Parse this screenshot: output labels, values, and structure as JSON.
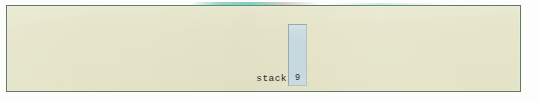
{
  "canvas": {
    "width": 539,
    "height": 102,
    "page_background": "#fdfdfb"
  },
  "panel": {
    "name": "memory-diagram-panel",
    "background_color": "#e6e5c9",
    "border_color": "#5c7a6c"
  },
  "stack": {
    "label": "stack",
    "cells": [
      {
        "value": "9"
      }
    ],
    "box_fill_color": "#c5d9de",
    "box_border_color": "#9aa8a6",
    "text_color": "#2a2a28"
  }
}
